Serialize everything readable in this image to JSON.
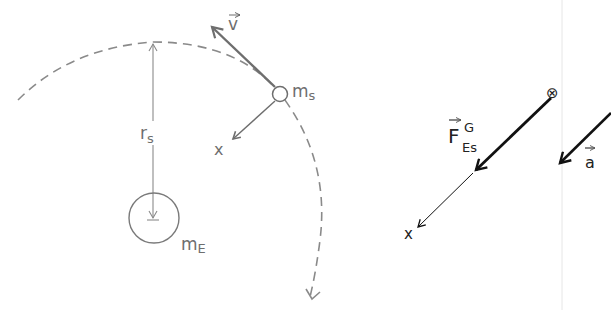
{
  "left_diagram": {
    "satellite_label": "m",
    "satellite_sub": "s",
    "earth_label": "m",
    "earth_sub": "E",
    "radius_label": "r",
    "radius_sub": "s",
    "velocity_label": "v",
    "axis_label": "x",
    "colors": {
      "stroke": "#7a7a7a",
      "dash": "#8a8a8a"
    }
  },
  "right_diagram": {
    "force_label": "F",
    "force_sup": "G",
    "force_sub": "Es",
    "acceleration_label": "a",
    "axis_label": "x",
    "point_symbol": "⊗",
    "colors": {
      "stroke": "#111111",
      "divider": "#e6e6e6"
    }
  }
}
